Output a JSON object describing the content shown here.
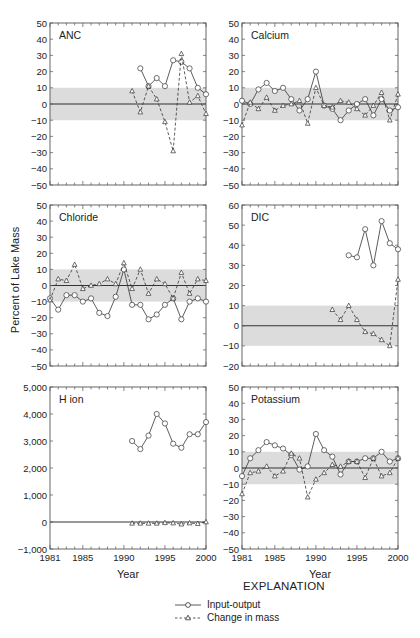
{
  "figure": {
    "ylabel_shared": "Percent of Lake Mass",
    "xlabel": "Year",
    "x_ticks": [
      1981,
      1985,
      1990,
      1995,
      2000
    ],
    "legend": {
      "title": "EXPLANATION",
      "items": [
        {
          "label": "Input-output",
          "style": "solid",
          "marker": "circle"
        },
        {
          "label": "Change in mass",
          "style": "dashed",
          "marker": "triangle"
        }
      ]
    },
    "colors": {
      "band": "#dcdcdc",
      "line": "#333333",
      "zero_line": "#333333",
      "frame": "#555555"
    }
  },
  "chart_data": [
    {
      "type": "line",
      "title": "ANC",
      "xlabel": "",
      "ylabel": "Percent of Lake Mass",
      "ylim": [
        -50,
        50
      ],
      "yticks": [
        50,
        40,
        30,
        20,
        10,
        0,
        -10,
        -20,
        -30,
        -40,
        -50
      ],
      "band": [
        -10,
        10
      ],
      "series": [
        {
          "name": "Input-output",
          "x": [
            1992,
            1993,
            1994,
            1995,
            1996,
            1997,
            1998,
            1999,
            2000
          ],
          "values": [
            22,
            11,
            16,
            11,
            27,
            26,
            22,
            10,
            6
          ]
        },
        {
          "name": "Change in mass",
          "x": [
            1991,
            1992,
            1993,
            1994,
            1995,
            1996,
            1997,
            1998,
            1999,
            2000
          ],
          "values": [
            8,
            -5,
            11,
            3,
            -11,
            -29,
            31,
            1,
            5,
            -6
          ]
        }
      ]
    },
    {
      "type": "line",
      "title": "Calcium",
      "xlabel": "",
      "ylabel": "",
      "ylim": [
        -50,
        50
      ],
      "yticks": [
        50,
        40,
        30,
        20,
        10,
        0,
        -10,
        -20,
        -30,
        -40,
        -50
      ],
      "band": [
        -10,
        10
      ],
      "series": [
        {
          "name": "Input-output",
          "x": [
            1981,
            1982,
            1983,
            1984,
            1985,
            1986,
            1987,
            1988,
            1989,
            1990,
            1991,
            1992,
            1993,
            1994,
            1995,
            1996,
            1997,
            1998,
            1999,
            2000
          ],
          "values": [
            2,
            0,
            9,
            13,
            8,
            10,
            3,
            -4,
            3,
            20,
            -1,
            -3,
            -10,
            -4,
            0,
            3,
            -7,
            3,
            -4,
            -2
          ]
        },
        {
          "name": "Change in mass",
          "x": [
            1981,
            1982,
            1983,
            1984,
            1985,
            1986,
            1987,
            1988,
            1989,
            1990,
            1991,
            1992,
            1993,
            1994,
            1995,
            1996,
            1997,
            1998,
            1999,
            2000
          ],
          "values": [
            -13,
            1,
            -3,
            4,
            -4,
            -1,
            0,
            2,
            -12,
            10,
            -1,
            -2,
            2,
            1,
            -3,
            -7,
            -1,
            7,
            -10,
            6
          ]
        }
      ]
    },
    {
      "type": "line",
      "title": "Chloride",
      "xlabel": "",
      "ylabel": "Percent of Lake Mass",
      "ylim": [
        -50,
        50
      ],
      "yticks": [
        50,
        40,
        30,
        20,
        10,
        0,
        -10,
        -20,
        -30,
        -40,
        -50
      ],
      "band": [
        -10,
        10
      ],
      "series": [
        {
          "name": "Input-output",
          "x": [
            1981,
            1982,
            1983,
            1984,
            1985,
            1986,
            1987,
            1988,
            1989,
            1990,
            1991,
            1992,
            1993,
            1994,
            1995,
            1996,
            1997,
            1998,
            1999,
            2000
          ],
          "values": [
            -8,
            -15,
            -6,
            -6,
            -10,
            -8,
            -17,
            -19,
            -7,
            10,
            -12,
            -12,
            -21,
            -18,
            -12,
            -8,
            -21,
            -10,
            -8,
            -10
          ]
        },
        {
          "name": "Change in mass",
          "x": [
            1981,
            1982,
            1983,
            1984,
            1985,
            1986,
            1987,
            1988,
            1989,
            1990,
            1991,
            1992,
            1993,
            1994,
            1995,
            1996,
            1997,
            1998,
            1999,
            2000
          ],
          "values": [
            -9,
            4,
            3,
            13,
            -2,
            0,
            1,
            4,
            1,
            14,
            -2,
            10,
            -5,
            4,
            1,
            -8,
            8,
            -5,
            4,
            3
          ]
        }
      ]
    },
    {
      "type": "line",
      "title": "DIC",
      "xlabel": "",
      "ylabel": "",
      "ylim": [
        -20,
        60
      ],
      "yticks": [
        60,
        50,
        40,
        30,
        20,
        10,
        0,
        -10,
        -20
      ],
      "band": [
        -10,
        10
      ],
      "series": [
        {
          "name": "Input-output",
          "x": [
            1994,
            1995,
            1996,
            1997,
            1998,
            1999,
            2000
          ],
          "values": [
            35,
            34,
            48,
            30,
            52,
            41,
            38
          ]
        },
        {
          "name": "Change in mass",
          "x": [
            1992,
            1993,
            1994,
            1995,
            1996,
            1997,
            1998,
            1999,
            2000
          ],
          "values": [
            8,
            3,
            10,
            3,
            -3,
            -4,
            -7,
            -10,
            23
          ]
        }
      ]
    },
    {
      "type": "line",
      "title": "H ion",
      "xlabel": "Year",
      "ylabel": "",
      "ylim": [
        -1000,
        5000
      ],
      "yticks": [
        5000,
        4000,
        3000,
        2000,
        1000,
        0,
        -1000
      ],
      "ytick_labels": [
        "5,000",
        "4,000",
        "3,000",
        "2,000",
        "1,000",
        "0",
        "−1,000"
      ],
      "band": null,
      "series": [
        {
          "name": "Input-output",
          "x": [
            1991,
            1992,
            1993,
            1994,
            1995,
            1996,
            1997,
            1998,
            1999,
            2000
          ],
          "values": [
            3000,
            2700,
            3200,
            4000,
            3650,
            2900,
            2750,
            3250,
            3250,
            3700
          ]
        },
        {
          "name": "Change in mass",
          "x": [
            1991,
            1992,
            1993,
            1994,
            1995,
            1996,
            1997,
            1998,
            1999,
            2000
          ],
          "values": [
            -50,
            -50,
            -50,
            -50,
            -30,
            -40,
            -80,
            -40,
            -60,
            0
          ]
        }
      ]
    },
    {
      "type": "line",
      "title": "Potassium",
      "xlabel": "Year",
      "ylabel": "",
      "ylim": [
        -50,
        50
      ],
      "yticks": [
        50,
        40,
        30,
        20,
        10,
        0,
        -10,
        -20,
        -30,
        -40,
        -50
      ],
      "band": [
        -10,
        10
      ],
      "series": [
        {
          "name": "Input-output",
          "x": [
            1981,
            1982,
            1983,
            1984,
            1985,
            1986,
            1987,
            1988,
            1989,
            1990,
            1991,
            1992,
            1993,
            1994,
            1995,
            1996,
            1997,
            1998,
            1999,
            2000
          ],
          "values": [
            -5,
            6,
            11,
            16,
            14,
            12,
            8,
            -1,
            1,
            21,
            11,
            7,
            -4,
            4,
            4,
            6,
            6,
            10,
            4,
            6
          ]
        },
        {
          "name": "Change in mass",
          "x": [
            1981,
            1982,
            1983,
            1984,
            1985,
            1986,
            1987,
            1988,
            1989,
            1990,
            1991,
            1992,
            1993,
            1994,
            1995,
            1996,
            1997,
            1998,
            1999,
            2000
          ],
          "values": [
            -16,
            -3,
            -2,
            1,
            -5,
            -2,
            9,
            6,
            -18,
            -7,
            -3,
            2,
            1,
            4,
            4,
            -6,
            6,
            -5,
            -3,
            6
          ]
        }
      ]
    }
  ]
}
